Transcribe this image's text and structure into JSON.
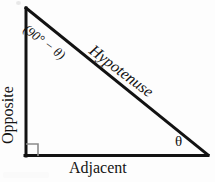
{
  "figure": {
    "background_color": "#fdfdfd",
    "stroke_color": "#121212",
    "stroke_width": 3,
    "right_angle_marker_color": "#8a8a8a"
  },
  "geometry": {
    "apex": {
      "x": 26,
      "y": 8
    },
    "right_angle_vertex": {
      "x": 26,
      "y": 156
    },
    "theta_vertex": {
      "x": 208,
      "y": 155
    },
    "right_angle_marker_size": 12
  },
  "labels": {
    "opposite": "Opposite",
    "adjacent": "Adjacent",
    "hypotenuse": "Hypotenuse",
    "complement_angle": "(90° − θ)",
    "theta": "θ"
  }
}
